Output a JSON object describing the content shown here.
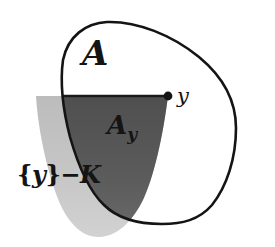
{
  "figure": {
    "background_color": "#ffffff",
    "width": 275,
    "height": 247
  },
  "labels": {
    "set_a": "A",
    "section_ay": "A",
    "section_ay_subscript": "y",
    "cone": {
      "open_brace": "{",
      "point": "y",
      "close_brace": "}",
      "operator": "−",
      "set_k": "K"
    },
    "point_y": "y"
  },
  "colors": {
    "outline": "#141414",
    "cone_light_gray": "#c0c0c0",
    "intersection_dark_gray": "#5a5a5a",
    "label_text": "#141414",
    "background": "#ffffff"
  },
  "shapes": {
    "blob": {
      "name": "set-a-boundary",
      "description": "closed irregular oval outline, pointed at upper-left, wide rounded lower-right",
      "stroke_width": 2.6
    },
    "cone": {
      "name": "translated-cone",
      "description": "downward opening wedge with apex at point y, flat horizontal top, curved sides, rounded bottom",
      "apex": {
        "x": 168,
        "y": 96
      },
      "top_line_y": 96,
      "top_left_x": 36,
      "bottom_y": 237
    },
    "intersection": {
      "name": "a-sub-y-region",
      "description": "overlap of cone and blob interior"
    }
  },
  "point": {
    "name": "apex-point-y",
    "x": 168,
    "y": 96,
    "radius": 4.4
  }
}
